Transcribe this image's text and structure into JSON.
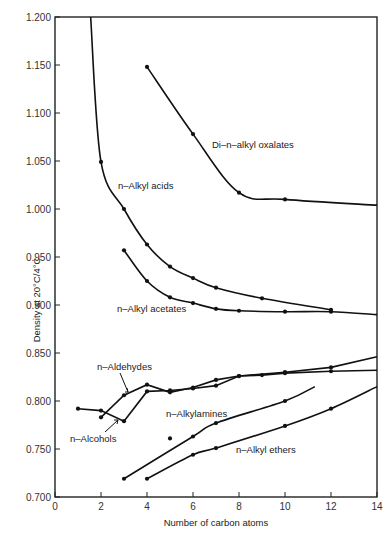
{
  "chart_data": {
    "type": "line",
    "title": "",
    "xlabel": "Number of carbon atoms",
    "ylabel": "Density at 20°C/4°C",
    "xlim": [
      0,
      14
    ],
    "ylim": [
      0.7,
      1.2
    ],
    "xticks": [
      "0",
      "2",
      "4",
      "6",
      "8",
      "10",
      "12",
      "14"
    ],
    "yticks": [
      "0.700",
      "0.750",
      "0.800",
      "0.850",
      "0.900",
      "0.950",
      "1.000",
      "1.050",
      "1.100",
      "1.150",
      "1.200"
    ],
    "grid": false,
    "legend": "inline labels",
    "series": [
      {
        "name": "Di-n-alkyl oxalates",
        "label": "Di–n–alkyl oxalates",
        "points": [
          [
            4,
            1.148
          ],
          [
            6,
            1.078
          ],
          [
            8,
            1.017
          ],
          [
            10,
            1.01
          ]
        ],
        "curve_end": [
          14,
          1.004
        ]
      },
      {
        "name": "n-Alkyl acids",
        "label": "n–Alkyl acids",
        "points": [
          [
            2,
            1.049
          ],
          [
            3,
            1.0
          ],
          [
            4,
            0.963
          ],
          [
            5,
            0.94
          ],
          [
            6,
            0.928
          ],
          [
            7,
            0.918
          ],
          [
            9,
            0.907
          ],
          [
            12,
            0.895
          ]
        ],
        "curve_start": [
          1.55,
          1.2
        ]
      },
      {
        "name": "n-Alkyl acetates",
        "label": "n–Alkyl acetates",
        "points": [
          [
            3,
            0.957
          ],
          [
            4,
            0.925
          ],
          [
            5,
            0.908
          ],
          [
            6,
            0.902
          ],
          [
            7,
            0.896
          ],
          [
            8,
            0.894
          ],
          [
            10,
            0.893
          ],
          [
            12,
            0.893
          ]
        ],
        "curve_end": [
          14,
          0.89
        ]
      },
      {
        "name": "n-Aldehydes",
        "label": "n–Aldehydes",
        "points": [
          [
            2,
            0.783
          ],
          [
            3,
            0.806
          ],
          [
            4,
            0.817
          ],
          [
            5,
            0.809
          ],
          [
            6,
            0.814
          ],
          [
            7,
            0.822
          ],
          [
            8,
            0.826
          ],
          [
            10,
            0.83
          ],
          [
            12,
            0.835
          ]
        ],
        "curve_end": [
          14,
          0.846
        ]
      },
      {
        "name": "n-Alcohols",
        "label": "n–Alcohols",
        "points": [
          [
            1,
            0.792
          ],
          [
            2,
            0.79
          ],
          [
            3,
            0.779
          ],
          [
            4,
            0.81
          ],
          [
            5,
            0.811
          ],
          [
            6,
            0.813
          ],
          [
            7,
            0.816
          ],
          [
            8,
            0.826
          ],
          [
            9,
            0.827
          ],
          [
            10,
            0.829
          ],
          [
            12,
            0.831
          ]
        ],
        "curve_end": [
          14,
          0.832
        ]
      },
      {
        "name": "n-Alkylamines",
        "label": "n–Alkylamines",
        "points": [
          [
            3,
            0.719
          ],
          [
            5,
            0.761
          ],
          [
            6,
            0.763
          ],
          [
            7,
            0.777
          ],
          [
            10,
            0.8
          ]
        ],
        "curve_end": [
          11.3,
          0.815
        ]
      },
      {
        "name": "n-Alkyl ethers",
        "label": "n–Alkyl ethers",
        "points": [
          [
            4,
            0.719
          ],
          [
            6,
            0.744
          ],
          [
            7,
            0.751
          ],
          [
            10,
            0.774
          ],
          [
            12,
            0.792
          ]
        ],
        "curve_end": [
          14,
          0.815
        ]
      }
    ]
  }
}
